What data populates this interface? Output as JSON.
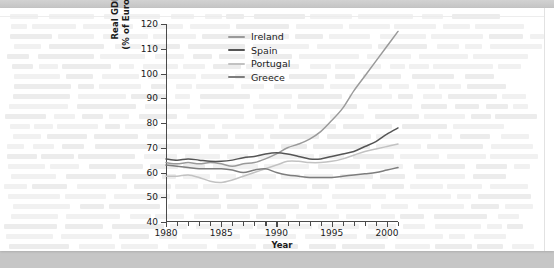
{
  "page": {
    "background_color": "#c6c6c6",
    "paper_color": "#ffffff"
  },
  "figure": {
    "x_axis_title": "Year",
    "y_axis_title_line1": "Real GDP per person",
    "y_axis_title_line2": "(% of European average)"
  },
  "legend": {
    "position": "top-left-inside",
    "items": [
      {
        "label": "Ireland",
        "color": "#9a9a9a"
      },
      {
        "label": "Spain",
        "color": "#555555"
      },
      {
        "label": "Portugal",
        "color": "#c2c2c2"
      },
      {
        "label": "Greece",
        "color": "#7d7d7d"
      }
    ]
  },
  "chart_data": {
    "type": "line",
    "title": "",
    "xlabel": "Year",
    "ylabel": "Real GDP per person (% of European average)",
    "xlim": [
      1980,
      2001
    ],
    "ylim": [
      40,
      120
    ],
    "yticks": [
      40,
      50,
      60,
      70,
      80,
      90,
      100,
      110,
      120
    ],
    "xticks_major": [
      1980,
      1985,
      1990,
      1995,
      2000
    ],
    "xticks_minor_step": 1,
    "grid": false,
    "x": [
      1980,
      1981,
      1982,
      1983,
      1984,
      1985,
      1986,
      1987,
      1988,
      1989,
      1990,
      1991,
      1992,
      1993,
      1994,
      1995,
      1996,
      1997,
      1998,
      1999,
      2000,
      2001
    ],
    "series": [
      {
        "name": "Ireland",
        "color": "#9a9a9a",
        "values": [
          64.0,
          63.5,
          64.0,
          63.5,
          64.0,
          63.5,
          62.5,
          63.5,
          64.0,
          65.5,
          67.5,
          70.0,
          71.5,
          73.5,
          76.5,
          81.0,
          86.0,
          93.0,
          99.0,
          105.0,
          111.0,
          117.0
        ]
      },
      {
        "name": "Spain",
        "color": "#555555",
        "values": [
          65.5,
          65.0,
          65.5,
          65.0,
          64.5,
          64.5,
          65.0,
          66.0,
          66.5,
          67.5,
          68.0,
          67.5,
          66.5,
          65.5,
          65.5,
          66.5,
          67.5,
          68.5,
          70.5,
          72.5,
          75.5,
          78.0
        ]
      },
      {
        "name": "Portugal",
        "color": "#c2c2c2",
        "values": [
          58.5,
          58.5,
          59.0,
          58.0,
          56.5,
          56.0,
          57.0,
          58.5,
          60.0,
          61.5,
          63.0,
          64.5,
          64.5,
          64.0,
          64.0,
          64.5,
          65.5,
          67.0,
          68.5,
          69.5,
          70.5,
          71.5
        ]
      },
      {
        "name": "Greece",
        "color": "#7d7d7d",
        "values": [
          63.0,
          62.5,
          62.0,
          61.5,
          61.5,
          61.5,
          61.0,
          60.0,
          61.0,
          61.5,
          60.0,
          59.0,
          58.5,
          58.0,
          58.0,
          58.0,
          58.5,
          59.0,
          59.5,
          60.0,
          61.0,
          62.0
        ]
      }
    ]
  }
}
